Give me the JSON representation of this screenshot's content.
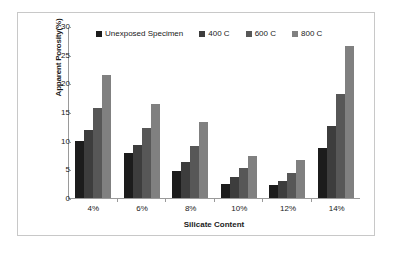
{
  "chart_data": {
    "type": "bar",
    "title": "",
    "xlabel": "Silicate Content",
    "ylabel": "Apparent Porosity(%)",
    "categories": [
      "4%",
      "6%",
      "8%",
      "10%",
      "12%",
      "14%"
    ],
    "series": [
      {
        "name": "Unexposed Specimen",
        "color": "#1c1c1c",
        "values": [
          9.9,
          7.8,
          4.7,
          2.4,
          2.2,
          8.8
        ]
      },
      {
        "name": "400 C",
        "color": "#3d3d3d",
        "values": [
          11.8,
          9.2,
          6.3,
          3.6,
          3.0,
          12.6
        ]
      },
      {
        "name": "600 C",
        "color": "#575757",
        "values": [
          15.7,
          12.2,
          9.1,
          5.2,
          4.4,
          18.2
        ]
      },
      {
        "name": "800 C",
        "color": "#808080",
        "values": [
          21.4,
          16.4,
          13.2,
          7.3,
          6.7,
          26.6
        ]
      }
    ],
    "ylim": [
      0,
      30
    ],
    "yticks": [
      30,
      25,
      20,
      15,
      10,
      5,
      0
    ],
    "grid": false,
    "legend_position": "top"
  },
  "legend": {
    "items": [
      {
        "label": "Unexposed Specimen"
      },
      {
        "label": "400 C"
      },
      {
        "label": "600 C"
      },
      {
        "label": "800 C"
      }
    ]
  },
  "colors": {
    "series_1": "#1c1c1c",
    "series_2": "#3d3d3d",
    "series_3": "#575757",
    "series_4": "#808080",
    "axis": "#9a9a9a",
    "frame_border": "#c8c8c8",
    "text": "#1a1a1a",
    "background": "#ffffff"
  }
}
